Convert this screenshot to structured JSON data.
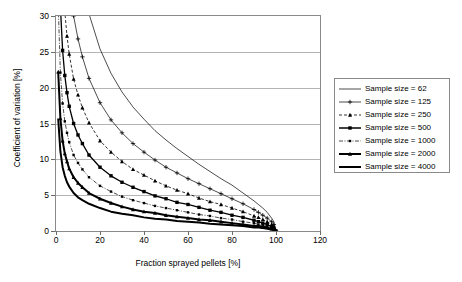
{
  "chart_data": {
    "type": "line",
    "title": "",
    "xlabel": "Fraction sprayed pellets [%]",
    "ylabel": "Coefficient of variation [%]",
    "xlim": [
      0,
      120
    ],
    "ylim": [
      0,
      30
    ],
    "xticks": [
      "0",
      "20",
      "40",
      "60",
      "80",
      "100",
      "120"
    ],
    "yticks": [
      "0",
      "5",
      "10",
      "15",
      "20",
      "25",
      "30"
    ],
    "grid": "horizontal",
    "legend_position": "right",
    "x": [
      1,
      2,
      3,
      4,
      5,
      6,
      8,
      10,
      12,
      15,
      20,
      25,
      30,
      35,
      40,
      45,
      50,
      55,
      60,
      65,
      70,
      75,
      80,
      85,
      90,
      92,
      94,
      96,
      98,
      99,
      100
    ],
    "series": [
      {
        "name": "Sample size = 62",
        "style": "thin-solid",
        "marker": "none",
        "values": [
          126.4,
          88.8,
          71.6,
          61.5,
          54.7,
          49.6,
          42.6,
          38.1,
          34.5,
          30.3,
          25.4,
          22.0,
          19.4,
          17.3,
          15.6,
          14.0,
          12.7,
          11.5,
          10.4,
          9.3,
          8.3,
          7.3,
          6.4,
          5.3,
          4.2,
          3.7,
          3.2,
          2.6,
          1.8,
          1.3,
          0.0
        ]
      },
      {
        "name": "Sample size = 125",
        "style": "thin-solid",
        "marker": "plus",
        "values": [
          89.0,
          62.6,
          50.4,
          43.3,
          38.5,
          34.9,
          30.0,
          26.8,
          24.3,
          21.3,
          17.9,
          15.5,
          13.7,
          12.2,
          11.0,
          9.9,
          8.9,
          8.1,
          7.3,
          6.6,
          5.9,
          5.2,
          4.5,
          3.8,
          3.0,
          2.6,
          2.2,
          1.8,
          1.3,
          0.9,
          0.0
        ]
      },
      {
        "name": "Sample size = 250",
        "style": "dashed",
        "marker": "triangle",
        "values": [
          62.9,
          44.3,
          35.6,
          30.6,
          27.2,
          24.7,
          21.2,
          19.0,
          17.2,
          15.1,
          12.6,
          11.0,
          9.7,
          8.6,
          7.8,
          7.0,
          6.3,
          5.7,
          5.2,
          4.6,
          4.1,
          3.7,
          3.2,
          2.7,
          2.1,
          1.9,
          1.6,
          1.3,
          0.9,
          0.6,
          0.0
        ]
      },
      {
        "name": "Sample size = 500",
        "style": "medium-solid",
        "marker": "square",
        "values": [
          44.5,
          31.3,
          25.2,
          21.7,
          19.3,
          17.4,
          15.0,
          13.4,
          12.2,
          10.6,
          8.9,
          7.7,
          6.8,
          6.1,
          5.5,
          4.9,
          4.5,
          4.0,
          3.7,
          3.3,
          2.9,
          2.6,
          2.2,
          1.9,
          1.5,
          1.3,
          1.1,
          0.9,
          0.6,
          0.4,
          0.0
        ]
      },
      {
        "name": "Sample size = 1000",
        "style": "thin-dash-dot",
        "marker": "small-square",
        "values": [
          31.5,
          22.1,
          17.8,
          15.3,
          13.7,
          12.4,
          10.6,
          9.5,
          8.6,
          7.5,
          6.3,
          5.5,
          4.8,
          4.3,
          3.9,
          3.5,
          3.2,
          2.9,
          2.6,
          2.3,
          2.1,
          1.8,
          1.6,
          1.3,
          1.1,
          0.9,
          0.8,
          0.6,
          0.5,
          0.3,
          0.0
        ]
      },
      {
        "name": "Sample size = 2000",
        "style": "thick-solid",
        "marker": "triangle",
        "values": [
          22.2,
          15.7,
          12.6,
          10.8,
          9.7,
          8.7,
          7.5,
          6.7,
          6.1,
          5.3,
          4.5,
          3.9,
          3.4,
          3.0,
          2.7,
          2.5,
          2.2,
          2.0,
          1.8,
          1.6,
          1.5,
          1.3,
          1.1,
          0.9,
          0.7,
          0.7,
          0.6,
          0.5,
          0.3,
          0.2,
          0.0
        ]
      },
      {
        "name": "Sample size = 4000",
        "style": "thick-solid",
        "marker": "none",
        "values": [
          15.7,
          11.1,
          8.9,
          7.7,
          6.8,
          6.2,
          5.3,
          4.7,
          4.3,
          3.8,
          3.2,
          2.7,
          2.4,
          2.2,
          1.9,
          1.7,
          1.6,
          1.4,
          1.3,
          1.2,
          1.0,
          0.9,
          0.8,
          0.7,
          0.5,
          0.5,
          0.4,
          0.3,
          0.2,
          0.2,
          0.0
        ]
      }
    ]
  }
}
